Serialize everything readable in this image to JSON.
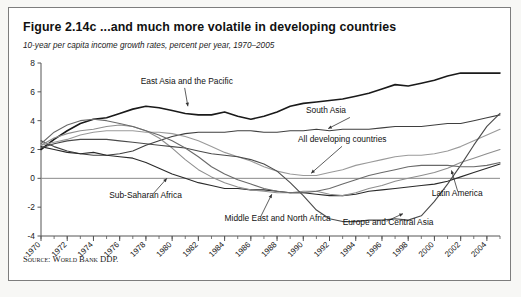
{
  "figure": {
    "title": "Figure 2.14c  ...and much more volatile in developing countries",
    "subtitle": "10-year per capita income growth rates, percent per year, 1970–2005",
    "source_label": "Source:",
    "source_text": "World Bank DDP.",
    "source_full": "Source: World Bank DDP."
  },
  "chart_data": {
    "type": "line",
    "title": "Figure 2.14c  ...and much more volatile in developing countries",
    "subtitle": "10-year per capita income growth rates, percent per year, 1970–2005",
    "xlabel": "",
    "ylabel": "",
    "ylim": [
      -4,
      8
    ],
    "yticks": [
      8,
      6,
      4,
      2,
      0,
      -2,
      -4
    ],
    "xlim": [
      1970,
      2005
    ],
    "xticks": [
      1970,
      1972,
      1974,
      1976,
      1978,
      1980,
      1982,
      1984,
      1986,
      1988,
      1990,
      1992,
      1994,
      1996,
      1998,
      2000,
      2002,
      2004
    ],
    "xtick_labels": [
      "1970",
      "1972",
      "1974",
      "1976",
      "1978",
      "1980",
      "1982",
      "1984",
      "1986",
      "1988",
      "1990",
      "1992",
      "1994",
      "1996",
      "1998",
      "2000",
      "2002",
      "2004"
    ],
    "minor_xticks_every": 1,
    "grid": false,
    "zero_line": true,
    "legend_position": "inline-annotations",
    "x": [
      1970,
      1971,
      1972,
      1973,
      1974,
      1975,
      1976,
      1977,
      1978,
      1979,
      1980,
      1981,
      1982,
      1983,
      1984,
      1985,
      1986,
      1987,
      1988,
      1989,
      1990,
      1991,
      1992,
      1993,
      1994,
      1995,
      1996,
      1997,
      1998,
      1999,
      2000,
      2001,
      2002,
      2003,
      2004,
      2005
    ],
    "series": [
      {
        "name": "East Asia and the Pacific",
        "color": "#1a1a1a",
        "width": 1.6,
        "label_x": 1977.6,
        "label_y": 6.55,
        "values": [
          2.0,
          2.7,
          3.3,
          3.8,
          4.1,
          4.2,
          4.5,
          4.8,
          5.0,
          4.9,
          4.7,
          4.5,
          4.4,
          4.4,
          4.6,
          4.3,
          4.1,
          4.3,
          4.6,
          5.0,
          5.2,
          5.3,
          5.4,
          5.5,
          5.7,
          5.9,
          6.2,
          6.5,
          6.4,
          6.6,
          6.8,
          7.1,
          7.3,
          7.3,
          7.3,
          7.3
        ]
      },
      {
        "name": "South Asia",
        "color": "#3f3f3f",
        "width": 1.1,
        "label_x": 1990.2,
        "label_y": 4.5,
        "values": [
          2.6,
          2.2,
          1.9,
          1.7,
          1.6,
          1.6,
          1.7,
          1.9,
          2.3,
          2.6,
          2.9,
          3.1,
          3.2,
          3.2,
          3.2,
          3.3,
          3.3,
          3.2,
          3.2,
          3.3,
          3.3,
          3.4,
          3.3,
          3.4,
          3.4,
          3.4,
          3.5,
          3.6,
          3.6,
          3.6,
          3.7,
          3.8,
          3.8,
          4.0,
          4.2,
          4.4
        ]
      },
      {
        "name": "All developing countries",
        "color": "#9a9a9a",
        "width": 1.1,
        "label_x": 1989.6,
        "label_y": 2.5,
        "values": [
          2.3,
          2.5,
          2.7,
          3.0,
          3.2,
          3.3,
          3.3,
          3.3,
          3.2,
          3.2,
          3.1,
          2.9,
          2.6,
          2.2,
          1.8,
          1.5,
          1.2,
          0.8,
          0.5,
          0.3,
          0.2,
          0.2,
          0.4,
          0.6,
          0.9,
          1.1,
          1.3,
          1.5,
          1.6,
          1.6,
          1.7,
          1.9,
          2.2,
          2.6,
          3.0,
          3.4
        ]
      },
      {
        "name": "Sub-Saharan Africa",
        "color": "#2a2a2a",
        "width": 1.1,
        "label_x": 1975.2,
        "label_y": -1.35,
        "values": [
          2.2,
          2.0,
          1.8,
          1.7,
          1.8,
          1.6,
          1.5,
          1.4,
          1.1,
          0.7,
          0.3,
          0.0,
          -0.3,
          -0.5,
          -0.7,
          -0.7,
          -0.8,
          -0.8,
          -0.9,
          -1.0,
          -1.0,
          -1.1,
          -1.2,
          -1.2,
          -1.1,
          -0.9,
          -0.8,
          -0.7,
          -0.6,
          -0.5,
          -0.4,
          -0.2,
          0.1,
          0.4,
          0.7,
          1.0
        ]
      },
      {
        "name": "Middle East and North Africa",
        "color": "#8e8e8e",
        "width": 1.1,
        "label_x": 1984.0,
        "label_y": -2.95,
        "values": [
          2.3,
          2.8,
          3.1,
          3.3,
          3.4,
          3.6,
          3.7,
          3.6,
          3.3,
          2.8,
          2.1,
          1.3,
          0.6,
          0.1,
          -0.3,
          -0.6,
          -0.8,
          -0.9,
          -1.0,
          -1.0,
          -0.9,
          -0.9,
          -1.1,
          -1.2,
          -1.0,
          -0.7,
          -0.5,
          -0.2,
          0.0,
          0.2,
          0.4,
          0.7,
          1.1,
          1.4,
          1.7,
          2.0
        ]
      },
      {
        "name": "Europe and Central Asia",
        "color": "#4a4a4a",
        "width": 1.1,
        "label_x": 1993.0,
        "label_y": -3.25,
        "values": [
          2.1,
          2.4,
          2.6,
          2.7,
          2.7,
          2.7,
          2.6,
          2.5,
          2.4,
          2.3,
          2.2,
          2.1,
          1.9,
          1.7,
          1.6,
          1.5,
          1.3,
          1.0,
          0.5,
          -0.3,
          -1.2,
          -2.2,
          -2.8,
          -3.0,
          -3.0,
          -2.9,
          -2.9,
          -2.8,
          -2.9,
          -2.6,
          -1.6,
          -0.4,
          0.9,
          2.3,
          3.6,
          4.5
        ]
      },
      {
        "name": "Latin America",
        "color": "#6a6a6a",
        "width": 1.1,
        "label_x": 1999.8,
        "label_y": -1.2,
        "values": [
          2.4,
          3.2,
          3.7,
          4.0,
          4.1,
          4.0,
          3.8,
          3.6,
          3.3,
          3.0,
          2.6,
          2.1,
          1.5,
          0.8,
          0.3,
          -0.1,
          -0.4,
          -0.7,
          -0.9,
          -1.0,
          -1.0,
          -0.9,
          -0.7,
          -0.4,
          -0.1,
          0.2,
          0.4,
          0.6,
          0.8,
          0.9,
          0.9,
          0.9,
          0.8,
          0.8,
          0.9,
          1.1
        ]
      }
    ],
    "annotations": [
      {
        "text": "East Asia and the Pacific",
        "anchor": "start"
      },
      {
        "text": "South Asia",
        "anchor": "start"
      },
      {
        "text": "All developing countries",
        "anchor": "start"
      },
      {
        "text": "Sub-Saharan Africa",
        "anchor": "start"
      },
      {
        "text": "Middle East and North Africa",
        "anchor": "start"
      },
      {
        "text": "Europe and Central Asia",
        "anchor": "start"
      },
      {
        "text": "Latin America",
        "anchor": "start"
      }
    ]
  }
}
